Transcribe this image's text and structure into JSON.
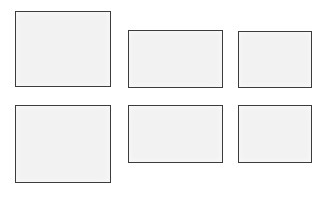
{
  "page": {
    "background_color": "#ffffff",
    "width": 329,
    "height": 197
  },
  "style": {
    "panel_fill": "#f2f2f2",
    "panel_border_color": "#3c3c3c",
    "panel_border_width_px": 1.5
  },
  "grid": {
    "rows": 2,
    "columns": 3,
    "panel_count": 6,
    "panels": [
      {
        "id": "panel-1",
        "row": 1,
        "column": 1,
        "content": "",
        "x": 15,
        "y": 11,
        "width": 96,
        "height": 76
      },
      {
        "id": "panel-2",
        "row": 1,
        "column": 2,
        "content": "",
        "x": 128,
        "y": 30,
        "width": 95,
        "height": 58
      },
      {
        "id": "panel-3",
        "row": 1,
        "column": 3,
        "content": "",
        "x": 238,
        "y": 31,
        "width": 74,
        "height": 57
      },
      {
        "id": "panel-4",
        "row": 2,
        "column": 1,
        "content": "",
        "x": 15,
        "y": 105,
        "width": 96,
        "height": 78
      },
      {
        "id": "panel-5",
        "row": 2,
        "column": 2,
        "content": "",
        "x": 128,
        "y": 105,
        "width": 95,
        "height": 58
      },
      {
        "id": "panel-6",
        "row": 2,
        "column": 3,
        "content": "",
        "x": 238,
        "y": 105,
        "width": 74,
        "height": 58
      }
    ]
  }
}
